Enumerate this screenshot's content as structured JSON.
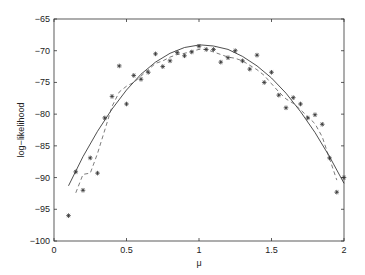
{
  "chart_data": {
    "type": "scatter",
    "title": "",
    "xlabel": "μ",
    "ylabel": "log−likelihood",
    "xlim": [
      0,
      2
    ],
    "ylim": [
      -100,
      -65
    ],
    "grid": false,
    "legend": null,
    "x_ticks": [
      0,
      0.5,
      1,
      1.5,
      2
    ],
    "x_tick_labels": [
      "0",
      "0.5",
      "1",
      "1.5",
      "2"
    ],
    "y_ticks": [
      -65,
      -70,
      -75,
      -80,
      -85,
      -90,
      -95,
      -100
    ],
    "y_tick_labels": [
      "−65",
      "−70",
      "−75",
      "−80",
      "−85",
      "−90",
      "−95",
      "−100"
    ],
    "series": [
      {
        "name": "samples",
        "style": "markers-asterisk",
        "x": [
          0.1,
          0.15,
          0.2,
          0.25,
          0.3,
          0.35,
          0.4,
          0.45,
          0.5,
          0.55,
          0.6,
          0.65,
          0.7,
          0.75,
          0.8,
          0.85,
          0.9,
          0.95,
          1.0,
          1.05,
          1.1,
          1.15,
          1.2,
          1.25,
          1.3,
          1.35,
          1.4,
          1.45,
          1.5,
          1.55,
          1.6,
          1.65,
          1.7,
          1.75,
          1.8,
          1.85,
          1.9,
          1.95,
          2.0
        ],
        "y": [
          -96,
          -89.1,
          -92,
          -86.9,
          -89.3,
          -80.6,
          -77.2,
          -72.4,
          -78.4,
          -73.9,
          -74.5,
          -73.4,
          -70.5,
          -72.5,
          -71.6,
          -70.3,
          -70.8,
          -70.2,
          -69.3,
          -69.8,
          -69.8,
          -71.8,
          -71.1,
          -70.0,
          -71.6,
          -72.9,
          -70.7,
          -75.0,
          -73.4,
          -77.0,
          -79.0,
          -77.4,
          -78.4,
          -80.6,
          -80.1,
          -81.6,
          -86.9,
          -92.3,
          -90.0
        ]
      },
      {
        "name": "smoothed",
        "style": "dashed",
        "x": [
          0.15,
          0.2,
          0.25,
          0.3,
          0.35,
          0.4,
          0.45,
          0.5,
          0.55,
          0.6,
          0.65,
          0.7,
          0.75,
          0.8,
          0.85,
          0.9,
          0.95,
          1.0,
          1.05,
          1.1,
          1.15,
          1.2,
          1.25,
          1.3,
          1.35,
          1.4,
          1.45,
          1.5,
          1.55,
          1.6,
          1.65,
          1.7,
          1.75,
          1.8,
          1.85,
          1.9,
          1.95
        ],
        "y": [
          -92.4,
          -89.5,
          -89.3,
          -86.2,
          -82.5,
          -78.8,
          -76.5,
          -75.6,
          -75.0,
          -74.0,
          -73.0,
          -72.0,
          -71.6,
          -71.0,
          -70.6,
          -70.4,
          -70.1,
          -69.8,
          -69.8,
          -70.2,
          -70.6,
          -71.0,
          -71.2,
          -71.6,
          -72.3,
          -73.0,
          -73.9,
          -75.2,
          -76.5,
          -77.6,
          -78.3,
          -79.3,
          -80.4,
          -81.5,
          -83.6,
          -87.0,
          -90.4
        ]
      },
      {
        "name": "fit",
        "style": "solid",
        "x": [
          0.1,
          0.2,
          0.3,
          0.4,
          0.5,
          0.6,
          0.7,
          0.8,
          0.9,
          1.0,
          1.02,
          1.1,
          1.2,
          1.3,
          1.4,
          1.5,
          1.6,
          1.7,
          1.8,
          1.9,
          2.0
        ],
        "y": [
          -91.3,
          -86.7,
          -82.7,
          -79.2,
          -76.2,
          -73.7,
          -71.8,
          -70.4,
          -69.5,
          -69.1,
          -69.1,
          -69.25,
          -69.8,
          -70.9,
          -72.4,
          -74.3,
          -76.7,
          -79.6,
          -82.9,
          -86.7,
          -90.9
        ]
      }
    ]
  }
}
